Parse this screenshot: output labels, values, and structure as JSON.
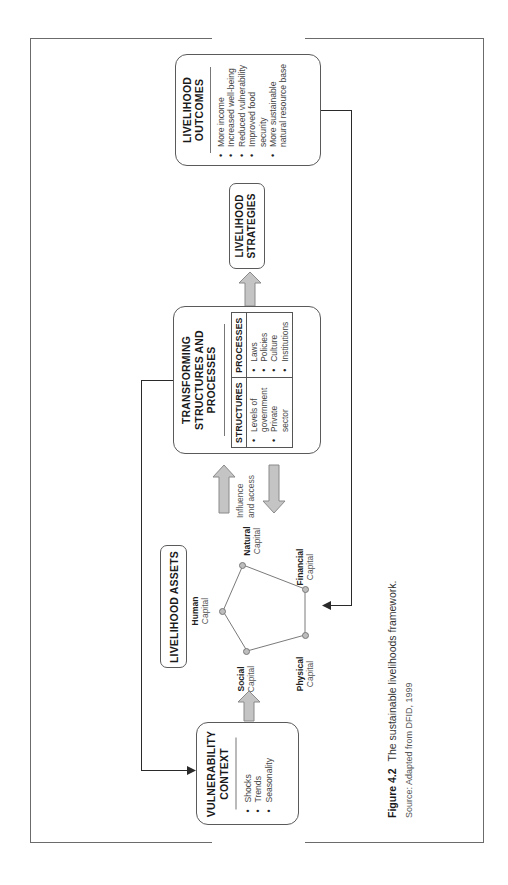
{
  "figure": {
    "caption_label": "Figure 4.2",
    "caption_text": "The sustainable livelihoods framework.",
    "source": "Source: Adapted from DFID, 1999",
    "orientation": "rotated 90 degrees counter-clockwise"
  },
  "colors": {
    "frame": "#6b6b6b",
    "box_border": "#5a5a5a",
    "arrow_fill": "#c4c4c4",
    "arrow_stroke": "#8a8a8a",
    "node_fill": "#bdbdbd",
    "connector": "#2a2a2a"
  },
  "vulnerability": {
    "title_line1": "VULNERABILITY",
    "title_line2": "CONTEXT",
    "items": [
      "Shocks",
      "Trends",
      "Seasonality"
    ]
  },
  "assets": {
    "title": "LIVELIHOOD ASSETS",
    "capitals": [
      {
        "name": "Human",
        "suffix": "Capital"
      },
      {
        "name": "Natural",
        "suffix": "Capital"
      },
      {
        "name": "Financial",
        "suffix": "Capital"
      },
      {
        "name": "Physical",
        "suffix": "Capital"
      },
      {
        "name": "Social",
        "suffix": "Capital"
      }
    ]
  },
  "influence": {
    "line1": "Influence",
    "line2": "and access"
  },
  "transforming": {
    "title_line1": "TRANSFORMING",
    "title_line2": "STRUCTURES AND",
    "title_line3": "PROCESSES",
    "table": {
      "headers": [
        "STRUCTURES",
        "PROCESSES"
      ],
      "structures": [
        "Levels of",
        "government",
        "Private",
        "sector"
      ],
      "processes": [
        "Laws",
        "Policies",
        "Culture",
        "Institutions"
      ]
    }
  },
  "strategies": {
    "title_line1": "LIVELIHOOD",
    "title_line2": "STRATEGIES"
  },
  "outcomes": {
    "title_line1": "LIVELIHOOD",
    "title_line2": "OUTCOMES",
    "items": [
      {
        "text": "More income",
        "bullet": true
      },
      {
        "text": "Increased well-being",
        "bullet": true
      },
      {
        "text": "Reduced vulnerability",
        "bullet": true
      },
      {
        "text": "Improved food",
        "bullet": true
      },
      {
        "text": "security",
        "bullet": false
      },
      {
        "text": "More sustainable",
        "bullet": true
      },
      {
        "text": "natural resource base",
        "bullet": false
      }
    ]
  }
}
